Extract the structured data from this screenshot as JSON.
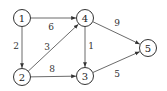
{
  "graph": {
    "type": "directed-weighted",
    "nodes": [
      {
        "id": "1",
        "label": "1",
        "x": 22,
        "y": 18
      },
      {
        "id": "2",
        "label": "2",
        "x": 22,
        "y": 77
      },
      {
        "id": "3",
        "label": "3",
        "x": 85,
        "y": 76
      },
      {
        "id": "4",
        "label": "4",
        "x": 85,
        "y": 18
      },
      {
        "id": "5",
        "label": "5",
        "x": 148,
        "y": 48
      }
    ],
    "edges": [
      {
        "from": "1",
        "to": "4",
        "weight": "6",
        "label_x": 51,
        "label_y": 27
      },
      {
        "from": "1",
        "to": "2",
        "weight": "2",
        "label_x": 16,
        "label_y": 46
      },
      {
        "from": "2",
        "to": "4",
        "weight": "3",
        "label_x": 47,
        "label_y": 47
      },
      {
        "from": "2",
        "to": "3",
        "weight": "8",
        "label_x": 52,
        "label_y": 69
      },
      {
        "from": "4",
        "to": "3",
        "weight": "1",
        "label_x": 91,
        "label_y": 46
      },
      {
        "from": "4",
        "to": "5",
        "weight": "9",
        "label_x": 117,
        "label_y": 23
      },
      {
        "from": "3",
        "to": "5",
        "weight": "5",
        "label_x": 117,
        "label_y": 74
      }
    ]
  }
}
